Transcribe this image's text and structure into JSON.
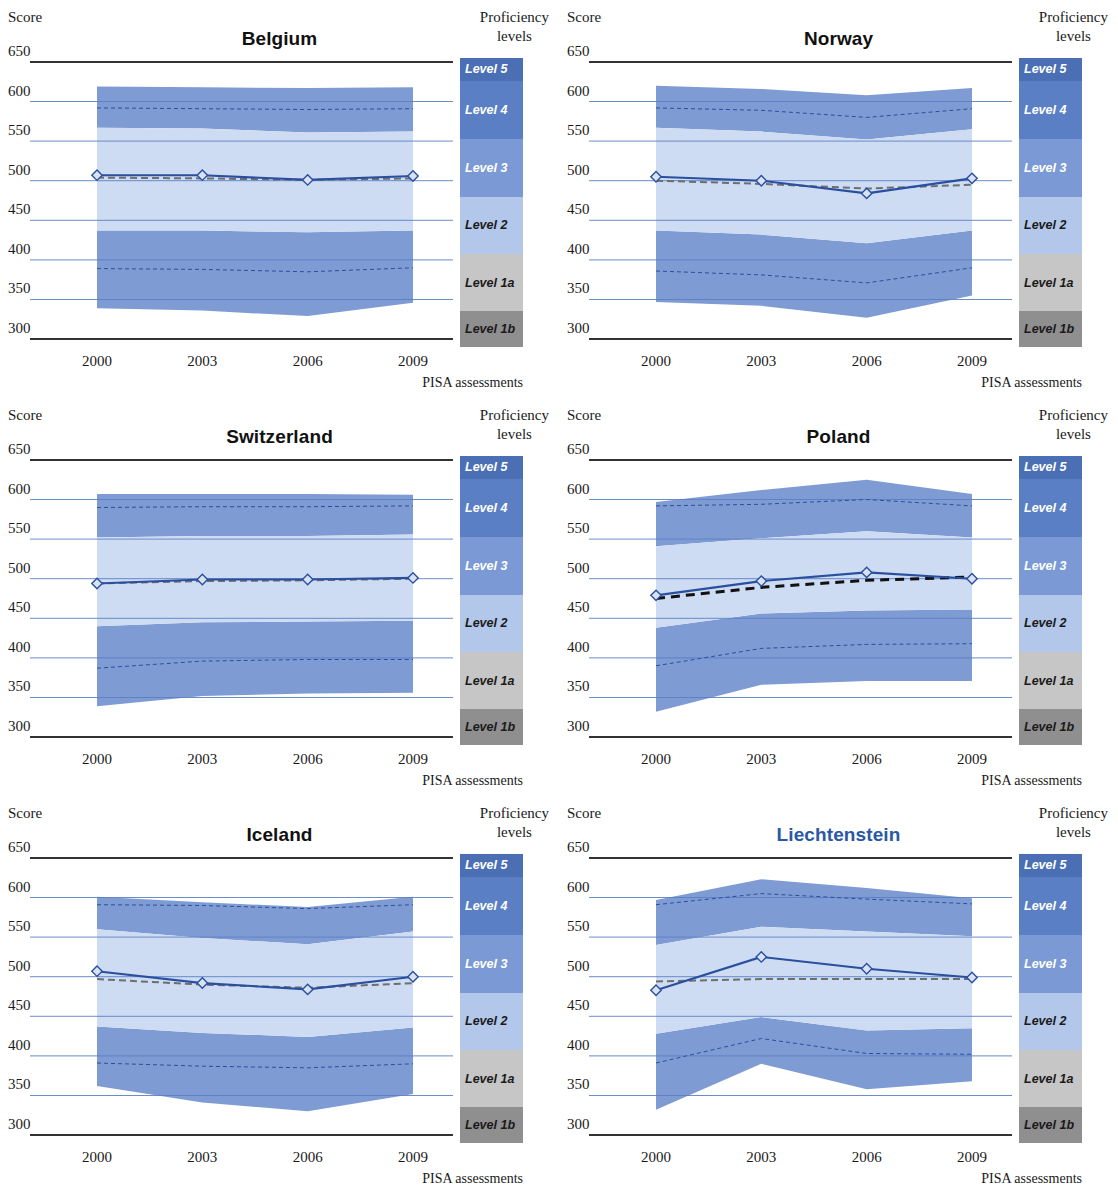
{
  "labels": {
    "score_header": "Score",
    "proficiency_header_line1": "Proficiency",
    "proficiency_header_line2": "levels",
    "xaxis_title": "PISA assessments"
  },
  "axis": {
    "y_ticks": [
      650,
      600,
      550,
      500,
      450,
      400,
      350,
      300
    ],
    "y_min": 290,
    "y_max": 655,
    "x_ticks": [
      "2000",
      "2003",
      "2006",
      "2009"
    ],
    "x_years": [
      2000,
      2003,
      2006,
      2009
    ]
  },
  "proficiency_levels": [
    {
      "label": "Level 5",
      "color": "#4a6fb5",
      "text_color": "#ffffff",
      "lower": 626,
      "upper": 655
    },
    {
      "label": "Level 4",
      "color": "#5b7fc4",
      "text_color": "#ffffff",
      "lower": 553,
      "upper": 626
    },
    {
      "label": "Level 3",
      "color": "#7b99d4",
      "text_color": "#ffffff",
      "lower": 480,
      "upper": 553
    },
    {
      "label": "Level 2",
      "color": "#b3c7ea",
      "text_color": "#1a1a1a",
      "lower": 407,
      "upper": 480
    },
    {
      "label": "Level 1a",
      "color": "#c6c6c6",
      "text_color": "#1a1a1a",
      "lower": 335,
      "upper": 407
    },
    {
      "label": "Level 1b",
      "color": "#8f8f8f",
      "text_color": "#1a1a1a",
      "lower": 290,
      "upper": 335
    }
  ],
  "style": {
    "band_outer_color": "#7e9bd4",
    "band_inner_color": "#cddcf2",
    "mean_line_color": "#2a4f9e",
    "trend_line_color": "#6e6e6e",
    "trend_line_color_strong": "#111111",
    "gridline_color": "#5b7fc4",
    "axis_color": "#333333",
    "marker_fill": "#d8e2f4",
    "accent_title_color": "#2a58a6"
  },
  "chart_data": [
    {
      "type": "area",
      "title": "Belgium",
      "title_accent": false,
      "xlabel": "PISA assessments",
      "ylabel": "Score",
      "ylim": [
        290,
        655
      ],
      "grid": true,
      "categories": [
        "2000",
        "2003",
        "2006",
        "2009"
      ],
      "trend_significant": false,
      "series": [
        {
          "name": "5th percentile",
          "values": [
            339,
            336,
            329,
            346
          ]
        },
        {
          "name": "10th percentile",
          "values": [
            389,
            388,
            385,
            390
          ]
        },
        {
          "name": "25th percentile",
          "values": [
            437,
            437,
            435,
            437
          ]
        },
        {
          "name": "Mean score",
          "values": [
            507,
            507,
            501,
            506
          ]
        },
        {
          "name": "75th percentile",
          "values": [
            567,
            566,
            561,
            562
          ]
        },
        {
          "name": "90th percentile",
          "values": [
            592,
            591,
            590,
            591
          ]
        },
        {
          "name": "95th percentile",
          "values": [
            619,
            618,
            617,
            618
          ]
        },
        {
          "name": "Trend line",
          "values": [
            504,
            503,
            501,
            503
          ]
        }
      ]
    },
    {
      "type": "area",
      "title": "Norway",
      "title_accent": false,
      "xlabel": "PISA assessments",
      "ylabel": "Score",
      "ylim": [
        290,
        655
      ],
      "grid": true,
      "categories": [
        "2000",
        "2003",
        "2006",
        "2009"
      ],
      "trend_significant": false,
      "series": [
        {
          "name": "5th percentile",
          "values": [
            347,
            342,
            327,
            355
          ]
        },
        {
          "name": "10th percentile",
          "values": [
            386,
            381,
            371,
            390
          ]
        },
        {
          "name": "25th percentile",
          "values": [
            437,
            432,
            421,
            437
          ]
        },
        {
          "name": "Mean score",
          "values": [
            505,
            500,
            484,
            503
          ]
        },
        {
          "name": "75th percentile",
          "values": [
            567,
            562,
            552,
            565
          ]
        },
        {
          "name": "90th percentile",
          "values": [
            592,
            589,
            580,
            591
          ]
        },
        {
          "name": "95th percentile",
          "values": [
            620,
            616,
            608,
            617
          ]
        },
        {
          "name": "Trend line",
          "values": [
            500,
            496,
            490,
            495
          ]
        }
      ]
    },
    {
      "type": "area",
      "title": "Switzerland",
      "title_accent": false,
      "xlabel": "PISA assessments",
      "ylabel": "Score",
      "ylim": [
        290,
        655
      ],
      "grid": true,
      "categories": [
        "2000",
        "2003",
        "2006",
        "2009"
      ],
      "trend_significant": false,
      "series": [
        {
          "name": "5th percentile",
          "values": [
            339,
            352,
            355,
            356
          ]
        },
        {
          "name": "10th percentile",
          "values": [
            387,
            396,
            398,
            398
          ]
        },
        {
          "name": "25th percentile",
          "values": [
            440,
            445,
            446,
            447
          ]
        },
        {
          "name": "Mean score",
          "values": [
            494,
            499,
            499,
            501
          ]
        },
        {
          "name": "75th percentile",
          "values": [
            552,
            554,
            554,
            556
          ]
        },
        {
          "name": "90th percentile",
          "values": [
            590,
            591,
            591,
            592
          ]
        },
        {
          "name": "95th percentile",
          "values": [
            607,
            607,
            607,
            606
          ]
        },
        {
          "name": "Trend line",
          "values": [
            494,
            497,
            498,
            500
          ]
        }
      ]
    },
    {
      "type": "area",
      "title": "Poland",
      "title_accent": false,
      "xlabel": "PISA assessments",
      "ylabel": "Score",
      "ylim": [
        290,
        655
      ],
      "grid": true,
      "categories": [
        "2000",
        "2003",
        "2006",
        "2009"
      ],
      "trend_significant": true,
      "series": [
        {
          "name": "5th percentile",
          "values": [
            332,
            366,
            371,
            371
          ]
        },
        {
          "name": "10th percentile",
          "values": [
            390,
            412,
            417,
            418
          ]
        },
        {
          "name": "25th percentile",
          "values": [
            438,
            456,
            460,
            461
          ]
        },
        {
          "name": "Mean score",
          "values": [
            479,
            497,
            508,
            500
          ]
        },
        {
          "name": "75th percentile",
          "values": [
            541,
            551,
            560,
            552
          ]
        },
        {
          "name": "90th percentile",
          "values": [
            592,
            594,
            600,
            592
          ]
        },
        {
          "name": "95th percentile",
          "values": [
            597,
            612,
            625,
            607
          ]
        },
        {
          "name": "Trend line",
          "values": [
            475,
            489,
            498,
            502
          ]
        }
      ]
    },
    {
      "type": "area",
      "title": "Iceland",
      "title_accent": false,
      "xlabel": "PISA assessments",
      "ylabel": "Score",
      "ylim": [
        290,
        655
      ],
      "grid": true,
      "categories": [
        "2000",
        "2003",
        "2006",
        "2009"
      ],
      "trend_significant": false,
      "series": [
        {
          "name": "5th percentile",
          "values": [
            362,
            341,
            330,
            352
          ]
        },
        {
          "name": "10th percentile",
          "values": [
            391,
            387,
            385,
            390
          ]
        },
        {
          "name": "25th percentile",
          "values": [
            437,
            429,
            424,
            436
          ]
        },
        {
          "name": "Mean score",
          "values": [
            507,
            492,
            484,
            500
          ]
        },
        {
          "name": "75th percentile",
          "values": [
            560,
            549,
            541,
            557
          ]
        },
        {
          "name": "90th percentile",
          "values": [
            591,
            590,
            586,
            591
          ]
        },
        {
          "name": "95th percentile",
          "values": [
            601,
            594,
            588,
            601
          ]
        },
        {
          "name": "Trend line",
          "values": [
            497,
            490,
            486,
            492
          ]
        }
      ]
    },
    {
      "type": "area",
      "title": "Liechtenstein",
      "title_accent": true,
      "xlabel": "PISA assessments",
      "ylabel": "Score",
      "ylim": [
        290,
        655
      ],
      "grid": true,
      "categories": [
        "2000",
        "2003",
        "2006",
        "2009"
      ],
      "trend_significant": false,
      "series": [
        {
          "name": "5th percentile",
          "values": [
            332,
            390,
            358,
            368
          ]
        },
        {
          "name": "10th percentile",
          "values": [
            391,
            422,
            403,
            402
          ]
        },
        {
          "name": "25th percentile",
          "values": [
            428,
            449,
            432,
            435
          ]
        },
        {
          "name": "Mean score",
          "values": [
            483,
            525,
            510,
            499
          ]
        },
        {
          "name": "75th percentile",
          "values": [
            540,
            563,
            557,
            551
          ]
        },
        {
          "name": "90th percentile",
          "values": [
            591,
            605,
            598,
            592
          ]
        },
        {
          "name": "95th percentile",
          "values": [
            597,
            623,
            612,
            599
          ]
        },
        {
          "name": "Trend line",
          "values": [
            494,
            497,
            497,
            497
          ]
        }
      ]
    }
  ]
}
